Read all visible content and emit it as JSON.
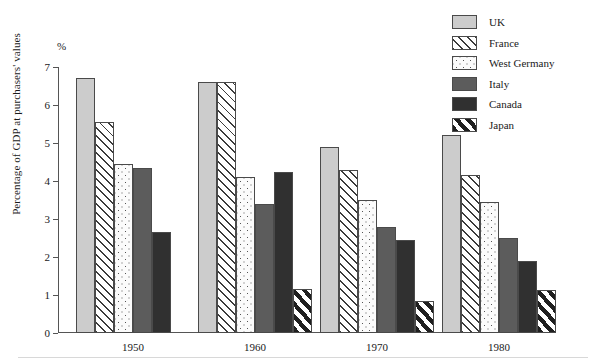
{
  "chart_data": {
    "type": "bar",
    "title": "",
    "xlabel": "",
    "ylabel": "Percentage of GDP at purchasers' values",
    "yunit": "%",
    "ylim": [
      0,
      7
    ],
    "yticks": [
      0,
      1,
      2,
      3,
      4,
      5,
      6,
      7
    ],
    "grid": false,
    "legend_position": "top-right",
    "categories": [
      "1950",
      "1960",
      "1970",
      "1980"
    ],
    "series": [
      {
        "name": "UK",
        "pattern": "solid-light-gray",
        "color": "#cccccc",
        "values": [
          6.7,
          6.6,
          4.9,
          5.2
        ]
      },
      {
        "name": "France",
        "pattern": "diagonal-hatch",
        "color": "#3b3b3b",
        "values": [
          5.55,
          6.6,
          4.3,
          4.15
        ]
      },
      {
        "name": "West Germany",
        "pattern": "dotted",
        "color": "#555555",
        "values": [
          4.45,
          4.1,
          3.5,
          3.45
        ]
      },
      {
        "name": "Italy",
        "pattern": "solid-mid-gray",
        "color": "#5c5c5c",
        "values": [
          4.35,
          3.4,
          2.8,
          2.5
        ]
      },
      {
        "name": "Canada",
        "pattern": "solid-dark-gray",
        "color": "#303030",
        "values": [
          2.65,
          4.25,
          2.45,
          1.9
        ]
      },
      {
        "name": "Japan",
        "pattern": "bold-diagonal",
        "color": "#1f1f1f",
        "values": [
          null,
          1.15,
          0.85,
          1.12
        ]
      }
    ]
  },
  "legend": {
    "items": [
      {
        "label": "UK"
      },
      {
        "label": "France"
      },
      {
        "label": "West Germany"
      },
      {
        "label": "Italy"
      },
      {
        "label": "Canada"
      },
      {
        "label": "Japan"
      }
    ]
  },
  "axis": {
    "unit_label": "%",
    "y_title": "Percentage of GDP at purchasers' values",
    "y_tick_labels": [
      "0",
      "1",
      "2",
      "3",
      "4",
      "5",
      "6",
      "7"
    ],
    "x_tick_labels": [
      "1950",
      "1960",
      "1970",
      "1980"
    ]
  }
}
